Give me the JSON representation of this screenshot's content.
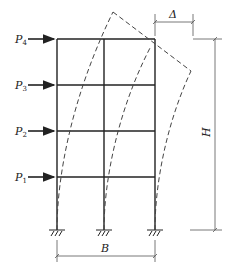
{
  "diagram": {
    "loads": [
      {
        "label": "P",
        "sub": "4",
        "y": 39
      },
      {
        "label": "P",
        "sub": "3",
        "y": 85
      },
      {
        "label": "P",
        "sub": "2",
        "y": 131
      },
      {
        "label": "P",
        "sub": "1",
        "y": 177
      }
    ],
    "dimensions": {
      "width_label": "B",
      "height_label": "H",
      "drift_label": "Δ"
    },
    "colors": {
      "line": "#222222",
      "dashed": "#444444",
      "dimension": "#555555"
    }
  }
}
